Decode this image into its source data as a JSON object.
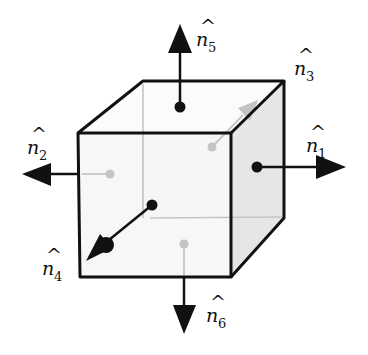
{
  "diagram": {
    "colors": {
      "edge": "#111111",
      "hidden": "#c4c4c4",
      "front_face": "#f6f6f6",
      "right_face": "#e6e6e6",
      "top_face": "#fbfbfb",
      "back_face": "#f2f2f2"
    },
    "vectors": [
      {
        "id": "n1",
        "symbol": "n",
        "hat": "^",
        "subscript": "1",
        "direction": "right",
        "visible": true
      },
      {
        "id": "n2",
        "symbol": "n",
        "hat": "^",
        "subscript": "2",
        "direction": "left",
        "visible": true
      },
      {
        "id": "n3",
        "symbol": "n",
        "hat": "^",
        "subscript": "3",
        "direction": "back",
        "visible": false
      },
      {
        "id": "n4",
        "symbol": "n",
        "hat": "^",
        "subscript": "4",
        "direction": "front",
        "visible": true
      },
      {
        "id": "n5",
        "symbol": "n",
        "hat": "^",
        "subscript": "5",
        "direction": "up",
        "visible": true
      },
      {
        "id": "n6",
        "symbol": "n",
        "hat": "^",
        "subscript": "6",
        "direction": "down",
        "visible": true
      }
    ]
  }
}
